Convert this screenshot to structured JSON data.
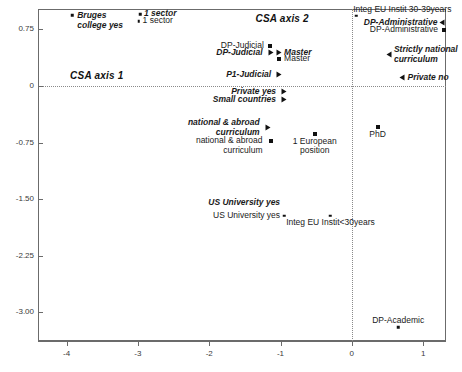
{
  "chart_data": {
    "type": "scatter",
    "title": "",
    "subtitle": "",
    "xlabel": "",
    "ylabel": "",
    "xlim": [
      -4.4,
      1.32
    ],
    "ylim": [
      -3.38,
      1.02
    ],
    "xticks": [
      "-4",
      "-3",
      "-2",
      "-1",
      "0",
      "1"
    ],
    "xtick_values": [
      -4,
      -3,
      -2,
      -1,
      0,
      1
    ],
    "yticks": [
      "0.75",
      "0",
      "-0.75",
      "-1.50",
      "-2.25",
      "-3.00"
    ],
    "ytick_values": [
      0.75,
      0,
      -0.75,
      -1.5,
      -2.25,
      -3.0
    ],
    "grid": false,
    "reference_lines": {
      "vertical_x": 0,
      "horizontal_y": 0,
      "style": "dotted"
    },
    "axis_captions": [
      {
        "text": "CSA axis 1",
        "x": -3.95,
        "y": 0.11
      },
      {
        "text": "CSA axis 2",
        "x": -1.35,
        "y": 0.86
      }
    ],
    "legend": {
      "position": "none",
      "entries": []
    },
    "marker_styles": {
      "supplementary": "triangle",
      "active": "square",
      "small": "dot"
    },
    "points": [
      {
        "label": "Bruges\ncollege yes",
        "x": -3.92,
        "y": 0.94,
        "style": "supplementary",
        "marker": "dot",
        "align": "left",
        "label_dx": 5,
        "label_dy": -4
      },
      {
        "label": "1 sector",
        "x": -2.97,
        "y": 0.95,
        "style": "supplementary",
        "marker": "dot",
        "align": "left",
        "label_dx": 4,
        "label_dy": -5
      },
      {
        "label": "1 sector",
        "x": -2.99,
        "y": 0.86,
        "style": "active",
        "marker": "dot",
        "align": "left",
        "label_dx": 4,
        "label_dy": -5
      },
      {
        "label": "Integ EU Instit 30-39years",
        "x": 0.06,
        "y": 0.93,
        "style": "active",
        "marker": "dot",
        "align": "left",
        "label_dx": -3,
        "label_dy": -11
      },
      {
        "label": "DP-Administrative",
        "x": 1.27,
        "y": 0.83,
        "style": "supplementary",
        "marker": "tri-l",
        "align": "right",
        "label_dx": -5,
        "label_dy": -5
      },
      {
        "label": "DP-Administrative",
        "x": 1.29,
        "y": 0.74,
        "style": "active",
        "marker": "square",
        "align": "right",
        "label_dx": -6,
        "label_dy": -5
      },
      {
        "label": "DP-Judicial",
        "x": -1.15,
        "y": 0.53,
        "style": "active",
        "marker": "square",
        "align": "right",
        "label_dx": -6,
        "label_dy": -5
      },
      {
        "label": "DP-Judicial",
        "x": -1.14,
        "y": 0.44,
        "style": "supplementary",
        "marker": "tri-r",
        "align": "right",
        "label_dx": -8,
        "label_dy": -5
      },
      {
        "label": "Master",
        "x": -1.02,
        "y": 0.44,
        "style": "supplementary",
        "marker": "tri-r",
        "align": "left",
        "label_dx": 5,
        "label_dy": -5
      },
      {
        "label": "Master",
        "x": -1.02,
        "y": 0.36,
        "style": "active",
        "marker": "square",
        "align": "left",
        "label_dx": 5,
        "label_dy": -5
      },
      {
        "label": "Strictly national\ncurriculum",
        "x": 0.52,
        "y": 0.41,
        "style": "supplementary",
        "marker": "tri-l",
        "align": "left",
        "label_dx": 5,
        "label_dy": -10
      },
      {
        "label": "P1-Judicial",
        "x": -1.02,
        "y": 0.14,
        "style": "supplementary",
        "marker": "tri-r",
        "align": "right",
        "label_dx": -8,
        "label_dy": -5
      },
      {
        "label": "Private no",
        "x": 0.71,
        "y": 0.1,
        "style": "supplementary",
        "marker": "tri-l",
        "align": "left",
        "label_dx": 5,
        "label_dy": -5
      },
      {
        "label": "Private yes",
        "x": -0.95,
        "y": -0.08,
        "style": "supplementary",
        "marker": "tri-r",
        "align": "right",
        "label_dx": -8,
        "label_dy": -5
      },
      {
        "label": "Small countries",
        "x": -0.95,
        "y": -0.19,
        "style": "supplementary",
        "marker": "tri-r",
        "align": "right",
        "label_dx": -8,
        "label_dy": -5
      },
      {
        "label": "national & abroad\ncurriculum",
        "x": -1.18,
        "y": -0.56,
        "style": "supplementary",
        "marker": "tri-r",
        "align": "right",
        "label_dx": -8,
        "label_dy": -10
      },
      {
        "label": "national & abroad\ncurriculum",
        "x": -1.14,
        "y": -0.73,
        "style": "active",
        "marker": "square",
        "align": "right",
        "label_dx": -8,
        "label_dy": -5
      },
      {
        "label": "1 European\nposition",
        "x": -0.52,
        "y": -0.63,
        "style": "active",
        "marker": "square",
        "align": "center",
        "label_dx": 0,
        "label_dy": 3
      },
      {
        "label": "PhD",
        "x": 0.36,
        "y": -0.55,
        "style": "active",
        "marker": "square",
        "align": "center",
        "label_dx": 0,
        "label_dy": 3
      },
      {
        "label": "US University yes",
        "x": -0.95,
        "y": -1.62,
        "style": "supplementary",
        "marker": "none",
        "align": "right",
        "label_dx": -4,
        "label_dy": -10
      },
      {
        "label": "US University yes",
        "x": -0.95,
        "y": -1.72,
        "style": "active",
        "marker": "dot",
        "align": "right",
        "label_dx": -4,
        "label_dy": -5
      },
      {
        "label": "Integ EU Instit<30years",
        "x": -0.3,
        "y": -1.72,
        "style": "active",
        "marker": "dot",
        "align": "center",
        "label_dx": 0,
        "label_dy": 2
      },
      {
        "label": "DP-Academic",
        "x": 0.65,
        "y": -3.2,
        "style": "active",
        "marker": "dot",
        "align": "center",
        "label_dx": 0,
        "label_dy": -11
      }
    ]
  }
}
